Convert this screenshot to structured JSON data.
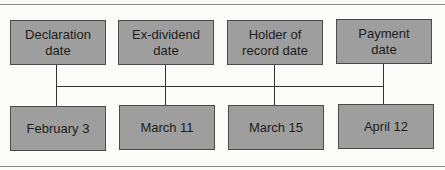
{
  "diagram": {
    "top_boxes": [
      {
        "label": "Declaration date"
      },
      {
        "label": "Ex-dividend date"
      },
      {
        "label": "Holder of record date"
      },
      {
        "label": "Payment date"
      }
    ],
    "bottom_boxes": [
      {
        "label": "February 3"
      },
      {
        "label": "March 11"
      },
      {
        "label": "March 15"
      },
      {
        "label": "April 12"
      }
    ],
    "colors": {
      "box_fill": "#9e9e9e",
      "line": "#333333"
    }
  }
}
